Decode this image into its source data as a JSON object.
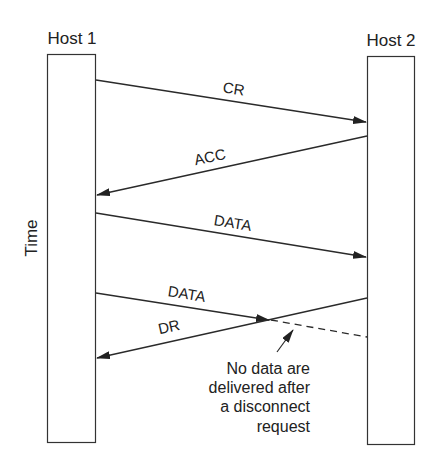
{
  "hosts": {
    "host1": {
      "label": "Host 1"
    },
    "host2": {
      "label": "Host 2"
    }
  },
  "axis": {
    "time_label": "Time"
  },
  "messages": [
    {
      "label": "CR",
      "from": "Host 1",
      "to": "Host 2",
      "style": "solid"
    },
    {
      "label": "ACC",
      "from": "Host 2",
      "to": "Host 1",
      "style": "solid"
    },
    {
      "label": "DATA",
      "from": "Host 1",
      "to": "Host 2",
      "style": "solid"
    },
    {
      "label": "DATA",
      "from": "Host 1",
      "to": "Host 2",
      "style": "solid-then-dashed (lost)"
    },
    {
      "label": "DR",
      "from": "Host 2",
      "to": "Host 1",
      "style": "solid"
    }
  ],
  "annotation": {
    "lines": [
      "No data are",
      "delivered after",
      "a disconnect",
      "request"
    ]
  },
  "colors": {
    "line": "#2a2a2a",
    "background": "#ffffff"
  }
}
